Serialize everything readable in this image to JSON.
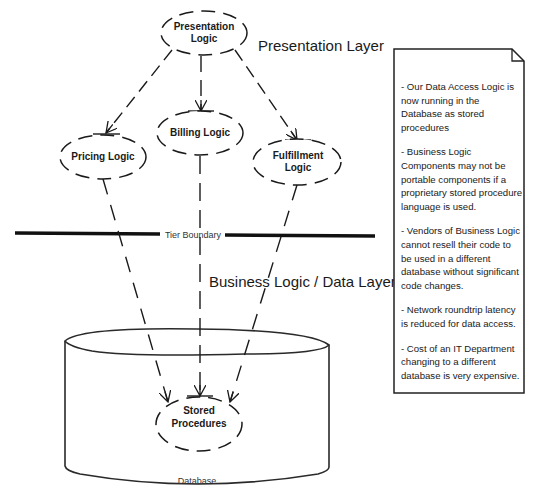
{
  "diagram": {
    "title_layers": {
      "presentation": "Presentation Layer",
      "business_data": "Business Logic / Data Layer"
    },
    "tier_boundary_label": "Tier Boundary",
    "nodes": {
      "presentation_logic": [
        "Presentation",
        "Logic"
      ],
      "pricing_logic": "Pricing Logic",
      "billing_logic": "Billing Logic",
      "fulfillment_logic": [
        "Fulfillment",
        "Logic"
      ],
      "stored_procedures": [
        "Stored",
        "Procedures"
      ]
    },
    "database_label": "Database",
    "edges": [
      {
        "from": "Presentation Logic",
        "to": "Pricing Logic",
        "style": "dashed-arrow"
      },
      {
        "from": "Presentation Logic",
        "to": "Billing Logic",
        "style": "dashed-arrow"
      },
      {
        "from": "Presentation Logic",
        "to": "Fulfillment Logic",
        "style": "dashed-arrow"
      },
      {
        "from": "Pricing Logic",
        "to": "Stored Procedures",
        "style": "dashed-arrow"
      },
      {
        "from": "Billing Logic",
        "to": "Stored Procedures",
        "style": "dashed-arrow"
      },
      {
        "from": "Fulfillment Logic",
        "to": "Stored Procedures",
        "style": "dashed-arrow"
      }
    ],
    "colors": {
      "stroke": "#1a1a1a",
      "background": "#ffffff"
    }
  },
  "note": {
    "items": [
      "- Our Data Access Logic is now running in the Database as stored procedures",
      "- Business Logic Components may not be portable components if a proprietary stored procedure language is used.",
      "- Vendors of Business Logic cannot resell their code to be used in a different database without significant code changes.",
      "- Network roundtrip latency is reduced for data access.",
      "- Cost of an IT Department changing to a different database is very expensive."
    ]
  }
}
